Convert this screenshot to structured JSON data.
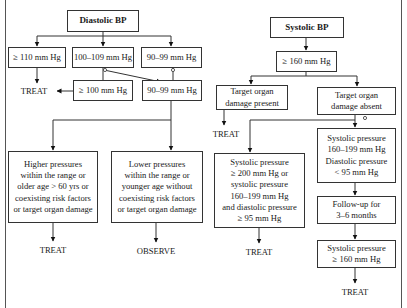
{
  "diastolic": {
    "title": "Diastolic BP",
    "ge110": "≥ 110 mm Hg",
    "r100_109": "100–109 mm Hg",
    "r90_99": "90–99 mm Hg",
    "treat_left": "TREAT",
    "ge100": "≥ 100 mm Hg",
    "r90_99_followup": "90–99 mm Hg",
    "higher_pressures": "Higher pressures\nwithin the range or\nolder age > 60 yrs or\ncoexisting risk factors\nor target organ damage",
    "lower_pressures": "Lower pressures\nwithin the range or\nyounger age without\ncoexisting risk factors\nor target organ damage",
    "treat_bottom": "TREAT",
    "observe": "OBSERVE"
  },
  "systolic": {
    "title": "Systolic BP",
    "ge160": "≥ 160 mm Hg",
    "damage_present": "Target organ\ndamage present",
    "damage_absent": "Target organ\ndamage absent",
    "treat_present": "TREAT",
    "high_or_combined": "Systolic pressure\n≥ 200 mm Hg or\nsystolic pressure\n160–199 mm Hg\nand diastolic pressure\n≥ 95 mm Hg",
    "treat_combined": "TREAT",
    "moderate": "Systolic pressure\n160–199 mm Hg\nDiastolic pressure\n< 95 mm Hg",
    "followup": "Follow-up for\n3–6 months",
    "recheck": "Systolic pressure\n≥ 160 mm Hg",
    "treat_final": "TREAT"
  }
}
